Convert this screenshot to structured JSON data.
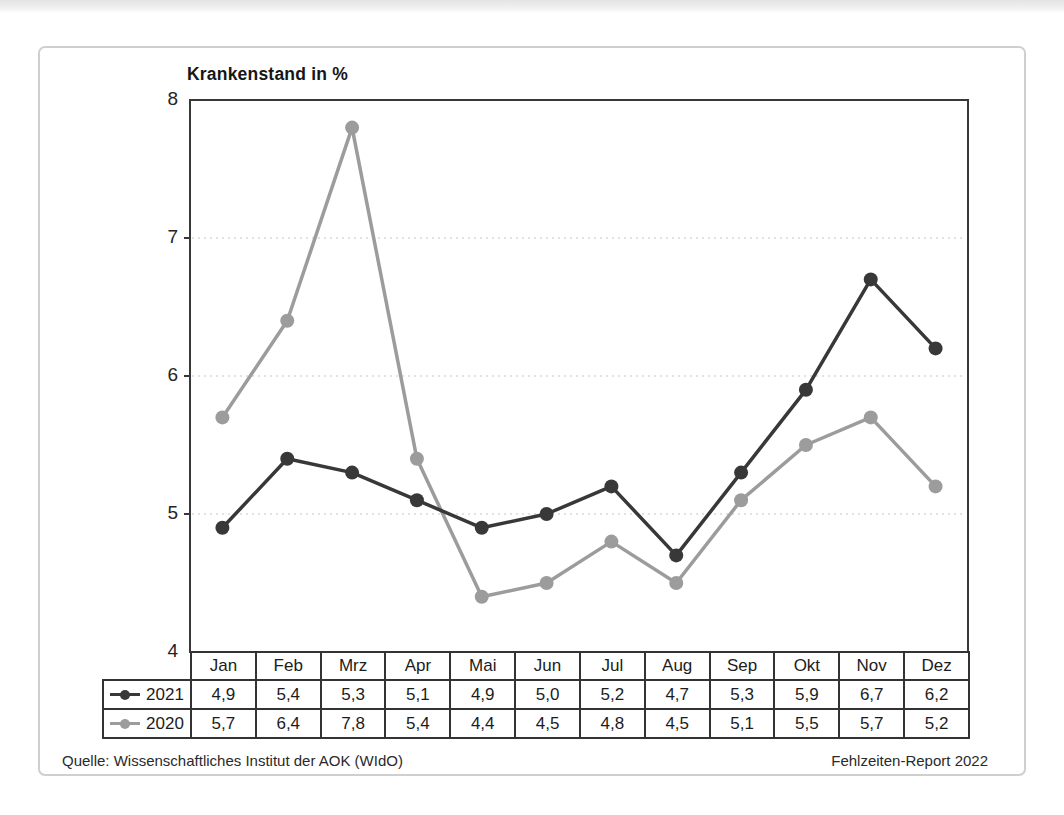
{
  "chart_data": {
    "type": "line",
    "title": "Krankenstand in %",
    "categories": [
      "Jan",
      "Feb",
      "Mrz",
      "Apr",
      "Mai",
      "Jun",
      "Jul",
      "Aug",
      "Sep",
      "Okt",
      "Nov",
      "Dez"
    ],
    "series": [
      {
        "name": "2021",
        "color": "#383838",
        "values": [
          4.9,
          5.4,
          5.3,
          5.1,
          4.9,
          5.0,
          5.2,
          4.7,
          5.3,
          5.9,
          6.7,
          6.2
        ],
        "display_values": [
          "4,9",
          "5,4",
          "5,3",
          "5,1",
          "4,9",
          "5,0",
          "5,2",
          "4,7",
          "5,3",
          "5,9",
          "6,7",
          "6,2"
        ]
      },
      {
        "name": "2020",
        "color": "#9c9c9c",
        "values": [
          5.7,
          6.4,
          7.8,
          5.4,
          4.4,
          4.5,
          4.8,
          4.5,
          5.1,
          5.5,
          5.7,
          5.2
        ],
        "display_values": [
          "5,7",
          "6,4",
          "7,8",
          "5,4",
          "4,4",
          "4,5",
          "4,8",
          "4,5",
          "5,1",
          "5,5",
          "5,7",
          "5,2"
        ]
      }
    ],
    "ylim": [
      4,
      8
    ],
    "yticks": [
      "8",
      "7",
      "6",
      "5",
      "4"
    ],
    "grid_values": [
      5,
      6,
      7
    ],
    "axis_color": "#383838",
    "grid_color": "#d9d9d9",
    "grid_on": true,
    "legend_position": "table-left"
  },
  "footer": {
    "source": "Quelle: Wissenschaftliches Institut der AOK (WIdO)",
    "report": "Fehlzeiten-Report 2022"
  }
}
